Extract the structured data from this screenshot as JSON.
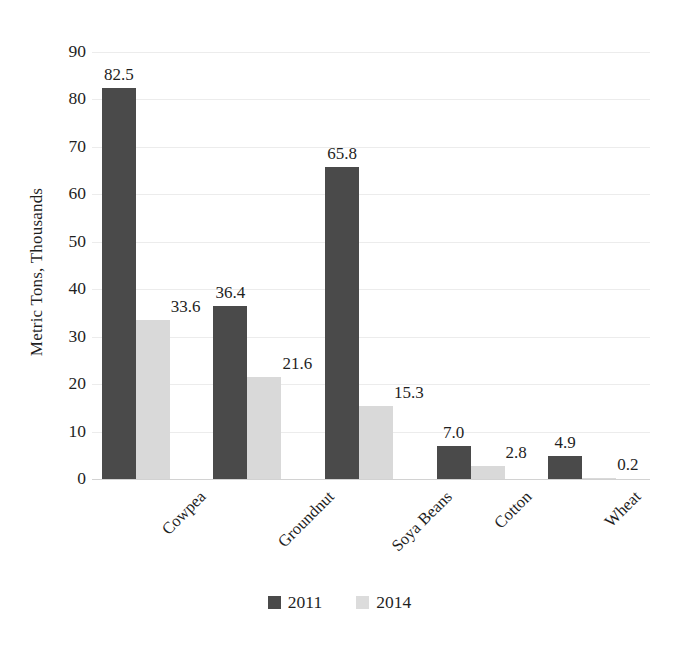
{
  "chart_data": {
    "type": "bar",
    "title": "",
    "subtitle": "",
    "xlabel": "",
    "ylabel": "Metric Tons, Thousands",
    "ylim": [
      0,
      90
    ],
    "ytick_step": 10,
    "yticks": [
      "90",
      "80",
      "70",
      "60",
      "50",
      "40",
      "30",
      "20",
      "10",
      "0"
    ],
    "grid": true,
    "grid_axis": "y",
    "legend_position": "bottom-center",
    "categories": [
      "Cowpea",
      "Groundnut",
      "Soya Beans",
      "Cotton",
      "Wheat"
    ],
    "series": [
      {
        "name": "2011",
        "color": "#4a4a4a",
        "values": [
          82.5,
          36.4,
          65.8,
          7.0,
          4.9
        ],
        "labels": [
          "82.5",
          "36.4",
          "65.8",
          "7.0",
          "4.9"
        ]
      },
      {
        "name": "2014",
        "color": "#d9d9d9",
        "values": [
          33.6,
          21.6,
          15.3,
          2.8,
          0.2
        ],
        "labels": [
          "33.6",
          "21.6",
          "15.3",
          "2.8",
          "0.2"
        ]
      }
    ]
  },
  "legend": {
    "items": [
      {
        "label": "2011",
        "color": "#4a4a4a"
      },
      {
        "label": "2014",
        "color": "#d9d9d9"
      }
    ]
  },
  "axes": {
    "y_title": "Metric Tons, Thousands"
  }
}
